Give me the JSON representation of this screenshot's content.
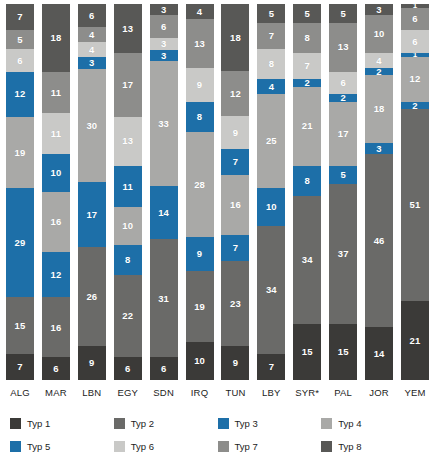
{
  "chart_data": {
    "type": "bar",
    "title": "",
    "subtitle": "",
    "xlabel": "",
    "ylabel": "",
    "stacked": true,
    "orientation": "vertical",
    "normalized_percent": true,
    "ylim": [
      0,
      100
    ],
    "grid": false,
    "legend_position": "bottom",
    "stack_order_top_to_bottom": [
      "Typ 8",
      "Typ 7",
      "Typ 6",
      "Typ 5",
      "Typ 4",
      "Typ 3",
      "Typ 2",
      "Typ 1"
    ],
    "categories": [
      "ALG",
      "MAR",
      "LBN",
      "EGY",
      "SDN",
      "IRQ",
      "TUN",
      "LBY",
      "SYR*",
      "PAL",
      "JOR",
      "YEM"
    ],
    "series": [
      {
        "name": "Typ 1",
        "color": "#3b3a38",
        "values": [
          7,
          6,
          9,
          6,
          6,
          10,
          9,
          7,
          15,
          15,
          14,
          21
        ]
      },
      {
        "name": "Typ 2",
        "color": "#6a6a68",
        "values": [
          15,
          16,
          26,
          22,
          31,
          19,
          23,
          34,
          34,
          37,
          46,
          51
        ]
      },
      {
        "name": "Typ 3",
        "color": "#1d6fa8",
        "values": [
          29,
          12,
          17,
          8,
          31,
          9,
          7,
          34,
          34,
          5,
          3,
          2
        ]
      },
      {
        "name": "Typ 4",
        "color": "#a9a9a7",
        "values": [
          19,
          16,
          26,
          10,
          33,
          28,
          16,
          25,
          21,
          17,
          18,
          51
        ]
      },
      {
        "name": "Typ 5",
        "color": "#1d6fa8",
        "values": [
          12,
          10,
          17,
          11,
          14,
          8,
          7,
          10,
          8,
          2,
          2,
          1
        ]
      },
      {
        "name": "Typ 6",
        "color": "#c9c9c7",
        "values": [
          6,
          11,
          4,
          13,
          3,
          9,
          9,
          8,
          7,
          6,
          4,
          6
        ]
      },
      {
        "name": "Typ 7",
        "color": "#8d8d8b",
        "values": [
          5,
          11,
          4,
          17,
          6,
          13,
          12,
          7,
          8,
          13,
          10,
          6
        ]
      },
      {
        "name": "Typ 8",
        "color": "#585856",
        "values": [
          7,
          18,
          6,
          13,
          3,
          4,
          18,
          5,
          5,
          5,
          3,
          1
        ]
      }
    ],
    "columns": [
      {
        "label": "ALG",
        "segments": [
          {
            "type": "Typ 8",
            "value": 7
          },
          {
            "type": "Typ 7",
            "value": 5
          },
          {
            "type": "Typ 6",
            "value": 6
          },
          {
            "type": "Typ 5",
            "value": 12
          },
          {
            "type": "Typ 4",
            "value": 19
          },
          {
            "type": "Typ 3",
            "value": 29
          },
          {
            "type": "Typ 2",
            "value": 15
          },
          {
            "type": "Typ 1",
            "value": 7
          }
        ]
      },
      {
        "label": "MAR",
        "segments": [
          {
            "type": "Typ 8",
            "value": 18
          },
          {
            "type": "Typ 7",
            "value": 11
          },
          {
            "type": "Typ 6",
            "value": 11
          },
          {
            "type": "Typ 5",
            "value": 10
          },
          {
            "type": "Typ 4",
            "value": 16
          },
          {
            "type": "Typ 3",
            "value": 12
          },
          {
            "type": "Typ 2",
            "value": 16
          },
          {
            "type": "Typ 1",
            "value": 6
          }
        ]
      },
      {
        "label": "LBN",
        "segments": [
          {
            "type": "Typ 8",
            "value": 6
          },
          {
            "type": "Typ 7",
            "value": 4
          },
          {
            "type": "Typ 6",
            "value": 4
          },
          {
            "type": "Typ 5",
            "value": 3
          },
          {
            "type": "Typ 4",
            "value": 30
          },
          {
            "type": "Typ 3",
            "value": 17
          },
          {
            "type": "Typ 2",
            "value": 26
          },
          {
            "type": "Typ 1",
            "value": 9
          }
        ]
      },
      {
        "label": "EGY",
        "segments": [
          {
            "type": "Typ 8",
            "value": 13
          },
          {
            "type": "Typ 7",
            "value": 17
          },
          {
            "type": "Typ 6",
            "value": 13
          },
          {
            "type": "Typ 5",
            "value": 11
          },
          {
            "type": "Typ 4",
            "value": 10
          },
          {
            "type": "Typ 3",
            "value": 8
          },
          {
            "type": "Typ 2",
            "value": 22
          },
          {
            "type": "Typ 1",
            "value": 6
          }
        ]
      },
      {
        "label": "SDN",
        "segments": [
          {
            "type": "Typ 8",
            "value": 3
          },
          {
            "type": "Typ 7",
            "value": 6
          },
          {
            "type": "Typ 6",
            "value": 3
          },
          {
            "type": "Typ 5",
            "value": 3
          },
          {
            "type": "Typ 4",
            "value": 33
          },
          {
            "type": "Typ 3",
            "value": 14
          },
          {
            "type": "Typ 2",
            "value": 31
          },
          {
            "type": "Typ 1",
            "value": 6
          }
        ]
      },
      {
        "label": "IRQ",
        "segments": [
          {
            "type": "Typ 8",
            "value": 4
          },
          {
            "type": "Typ 7",
            "value": 13
          },
          {
            "type": "Typ 6",
            "value": 9
          },
          {
            "type": "Typ 5",
            "value": 8
          },
          {
            "type": "Typ 4",
            "value": 28
          },
          {
            "type": "Typ 3",
            "value": 9
          },
          {
            "type": "Typ 2",
            "value": 19
          },
          {
            "type": "Typ 1",
            "value": 10
          }
        ]
      },
      {
        "label": "TUN",
        "segments": [
          {
            "type": "Typ 8",
            "value": 18
          },
          {
            "type": "Typ 7",
            "value": 12
          },
          {
            "type": "Typ 6",
            "value": 9
          },
          {
            "type": "Typ 5",
            "value": 7
          },
          {
            "type": "Typ 4",
            "value": 16
          },
          {
            "type": "Typ 3",
            "value": 7
          },
          {
            "type": "Typ 2",
            "value": 23
          },
          {
            "type": "Typ 1",
            "value": 9
          }
        ]
      },
      {
        "label": "LBY",
        "segments": [
          {
            "type": "Typ 8",
            "value": 5
          },
          {
            "type": "Typ 7",
            "value": 7
          },
          {
            "type": "Typ 6",
            "value": 8
          },
          {
            "type": "Typ 5",
            "value": 4
          },
          {
            "type": "Typ 4",
            "value": 25
          },
          {
            "type": "Typ 3",
            "value": 10
          },
          {
            "type": "Typ 2",
            "value": 34
          },
          {
            "type": "Typ 1",
            "value": 7
          }
        ]
      },
      {
        "label": "SYR*",
        "segments": [
          {
            "type": "Typ 8",
            "value": 5
          },
          {
            "type": "Typ 7",
            "value": 8
          },
          {
            "type": "Typ 6",
            "value": 7
          },
          {
            "type": "Typ 5",
            "value": 2
          },
          {
            "type": "Typ 4",
            "value": 21
          },
          {
            "type": "Typ 3",
            "value": 8
          },
          {
            "type": "Typ 2",
            "value": 34
          },
          {
            "type": "Typ 1",
            "value": 15
          }
        ]
      },
      {
        "label": "PAL",
        "segments": [
          {
            "type": "Typ 8",
            "value": 5
          },
          {
            "type": "Typ 7",
            "value": 13
          },
          {
            "type": "Typ 6",
            "value": 6
          },
          {
            "type": "Typ 5",
            "value": 2
          },
          {
            "type": "Typ 4",
            "value": 17
          },
          {
            "type": "Typ 3",
            "value": 5
          },
          {
            "type": "Typ 2",
            "value": 37
          },
          {
            "type": "Typ 1",
            "value": 15
          }
        ]
      },
      {
        "label": "JOR",
        "segments": [
          {
            "type": "Typ 8",
            "value": 3
          },
          {
            "type": "Typ 7",
            "value": 10
          },
          {
            "type": "Typ 6",
            "value": 4
          },
          {
            "type": "Typ 5",
            "value": 2
          },
          {
            "type": "Typ 4",
            "value": 18
          },
          {
            "type": "Typ 3",
            "value": 3
          },
          {
            "type": "Typ 2",
            "value": 46
          },
          {
            "type": "Typ 1",
            "value": 14
          }
        ]
      },
      {
        "label": "YEM",
        "segments": [
          {
            "type": "Typ 8",
            "value": 1
          },
          {
            "type": "Typ 7",
            "value": 6
          },
          {
            "type": "Typ 6",
            "value": 6
          },
          {
            "type": "Typ 5",
            "value": 1
          },
          {
            "type": "Typ 4",
            "value": 12
          },
          {
            "type": "Typ 3",
            "value": 2
          },
          {
            "type": "Typ 2",
            "value": 51
          },
          {
            "type": "Typ 1",
            "value": 21
          }
        ]
      }
    ]
  },
  "legend": {
    "items": [
      {
        "label": "Typ 1",
        "color": "#3b3a38"
      },
      {
        "label": "Typ 2",
        "color": "#6a6a68"
      },
      {
        "label": "Typ 3",
        "color": "#1d6fa8"
      },
      {
        "label": "Typ 4",
        "color": "#a9a9a7"
      },
      {
        "label": "Typ 5",
        "color": "#1d6fa8"
      },
      {
        "label": "Typ 6",
        "color": "#c9c9c7"
      },
      {
        "label": "Typ 7",
        "color": "#8d8d8b"
      },
      {
        "label": "Typ 8",
        "color": "#585856"
      }
    ]
  },
  "colors": {
    "typ1": "#3b3a38",
    "typ2": "#6a6a68",
    "typ3": "#1d6fa8",
    "typ4": "#a9a9a7",
    "typ5": "#1d6fa8",
    "typ6": "#c9c9c7",
    "typ7": "#8d8d8b",
    "typ8": "#585856",
    "background": "#ffffff",
    "text": "#1c1c1c",
    "segment_label": "#ffffff"
  }
}
